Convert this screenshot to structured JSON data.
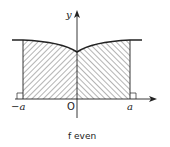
{
  "figure": {
    "caption": "f even",
    "axes": {
      "y_label": "y",
      "origin_label": "O",
      "left_bound_label": "−a",
      "right_bound_label": "a"
    },
    "colors": {
      "line": "#222222",
      "hatch": "#444444",
      "background": "#ffffff"
    }
  }
}
